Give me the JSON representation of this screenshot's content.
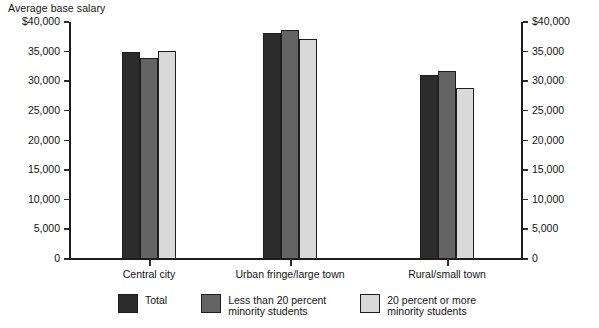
{
  "chart_data": {
    "type": "bar",
    "title": "",
    "ylabel": "Average base salary",
    "xlabel": "",
    "ylim": [
      0,
      40000
    ],
    "grid": false,
    "legend_position": "bottom",
    "dual_y_axis": true,
    "categories": [
      "Central city",
      "Urban fringe/large town",
      "Rural/small town"
    ],
    "ytick_labels": [
      "$40,000",
      "35,000",
      "30,000",
      "25,000",
      "20,000",
      "15,000",
      "10,000",
      "5,000",
      "0"
    ],
    "ytick_values": [
      40000,
      35000,
      30000,
      25000,
      20000,
      15000,
      10000,
      5000,
      0
    ],
    "series": [
      {
        "name": "Total",
        "color": "#2c2c2c",
        "values": [
          34900,
          38100,
          31000
        ]
      },
      {
        "name": "Less than 20 percent\nminority students",
        "color": "#646464",
        "values": [
          33900,
          38600,
          31700
        ]
      },
      {
        "name": "20 percent or more\nminority students",
        "color": "#d9d9d9",
        "values": [
          35100,
          37100,
          28900
        ]
      }
    ]
  },
  "axis": {
    "y_title": "Average base salary"
  },
  "legend": {
    "items": [
      {
        "label": "Total",
        "color": "#2c2c2c"
      },
      {
        "label": "Less than 20 percent\nminority students",
        "color": "#646464"
      },
      {
        "label": "20 percent or more\nminority students",
        "color": "#d9d9d9"
      }
    ]
  }
}
